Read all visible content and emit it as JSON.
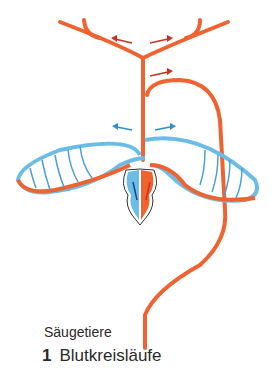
{
  "figure": {
    "subtitle": "Säugetiere",
    "caption_number": "1",
    "caption_text": "Blutkreisläufe"
  },
  "colors": {
    "oxygenated": "#f0622f",
    "deoxygenated": "#6bbde6",
    "arrow_red": "#c8321e",
    "arrow_blue": "#2f8fd0",
    "arrow_dark_blue": "#1f3f8f"
  }
}
